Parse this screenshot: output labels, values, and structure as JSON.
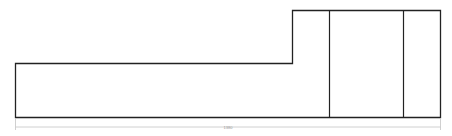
{
  "drawing": {
    "type": "stepped-profile-elevation",
    "outline_color": "#222222",
    "dimension_color": "#c4c4c4",
    "sections": [
      {
        "name": "low-section",
        "label": ""
      },
      {
        "name": "raised-section-1",
        "label": ""
      },
      {
        "name": "raised-section-2",
        "label": ""
      },
      {
        "name": "raised-section-3",
        "label": ""
      }
    ],
    "overall_dimension": {
      "label": "1380"
    }
  }
}
